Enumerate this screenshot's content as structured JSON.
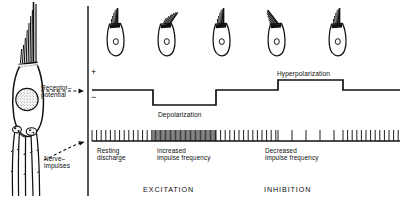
{
  "figure": {
    "type": "physiology-diagram",
    "title_absent": true
  },
  "left_panel": {
    "cell_name": "hair-cell",
    "annotations": [
      {
        "id": "receptor-potential",
        "line1": "Receptor–",
        "line2": "potential",
        "x": 41,
        "y": 88
      },
      {
        "id": "nerve-impulses",
        "line1": "Nerve–",
        "line2": "impulses",
        "x": 44,
        "y": 150
      }
    ]
  },
  "trace_panel": {
    "axis": {
      "vertical_x": 88,
      "plus_label": "+",
      "minus_label": "−",
      "plus_pos": {
        "x": 91,
        "y": 72
      },
      "minus_pos": {
        "x": 91,
        "y": 97
      }
    },
    "receptor_trace": {
      "name": "receptor-potential-trace",
      "baseline_y": 90,
      "depolarized_y": 105,
      "hyperpolarized_y": 80,
      "start_x": 92,
      "end_x": 400,
      "events": [
        {
          "label": "Depolarization",
          "direction": "down",
          "from_x": 153,
          "to_x": 216,
          "label_x": 158,
          "label_y": 113
        },
        {
          "label": "Hyperpolarization",
          "direction": "up",
          "from_x": 278,
          "to_x": 343,
          "label_x": 277,
          "label_y": 73
        }
      ]
    },
    "spike_train": {
      "name": "nerve-impulse-train",
      "axis_y": 141,
      "spike_height": 11,
      "start_x": 92,
      "end_x": 400,
      "segments": [
        {
          "id": "resting-discharge-left",
          "from_x": 92,
          "to_x": 153,
          "interval": 4.6,
          "rate": "resting"
        },
        {
          "id": "increased-frequency",
          "from_x": 153,
          "to_x": 216,
          "interval": 1.25,
          "rate": "increased"
        },
        {
          "id": "resting-discharge-mid",
          "from_x": 216,
          "to_x": 278,
          "interval": 4.6,
          "rate": "resting"
        },
        {
          "id": "decreased-frequency",
          "from_x": 278,
          "to_x": 343,
          "interval": 14.0,
          "rate": "decreased"
        },
        {
          "id": "resting-discharge-right",
          "from_x": 343,
          "to_x": 400,
          "interval": 4.6,
          "rate": "resting"
        }
      ],
      "labels": [
        {
          "id": "resting-discharge",
          "line1": "Resting",
          "line2": "discharge",
          "x": 97,
          "y": 152
        },
        {
          "id": "increased-impulse-frequency",
          "line1": "Increased",
          "line2": "impulse frequency",
          "x": 157,
          "y": 152
        },
        {
          "id": "decreased-impulse-frequency",
          "line1": "Decreased",
          "line2": "impulse frequency",
          "x": 265,
          "y": 152
        }
      ]
    },
    "cells": [
      {
        "id": "cell-1",
        "x": 116,
        "y": 30,
        "tilt": 0
      },
      {
        "id": "cell-2",
        "x": 167,
        "y": 30,
        "tilt": 34
      },
      {
        "id": "cell-3",
        "x": 222,
        "y": 30,
        "tilt": 0
      },
      {
        "id": "cell-4",
        "x": 277,
        "y": 30,
        "tilt": -38
      },
      {
        "id": "cell-5",
        "x": 338,
        "y": 30,
        "tilt": 0
      }
    ],
    "phase_labels": [
      {
        "id": "excitation",
        "text": "EXCITATION",
        "x": 143,
        "y": 190
      },
      {
        "id": "inhibition",
        "text": "INHIBITION",
        "x": 264,
        "y": 190
      }
    ]
  },
  "colors": {
    "ink": "#111111",
    "background": "#ffffff"
  }
}
